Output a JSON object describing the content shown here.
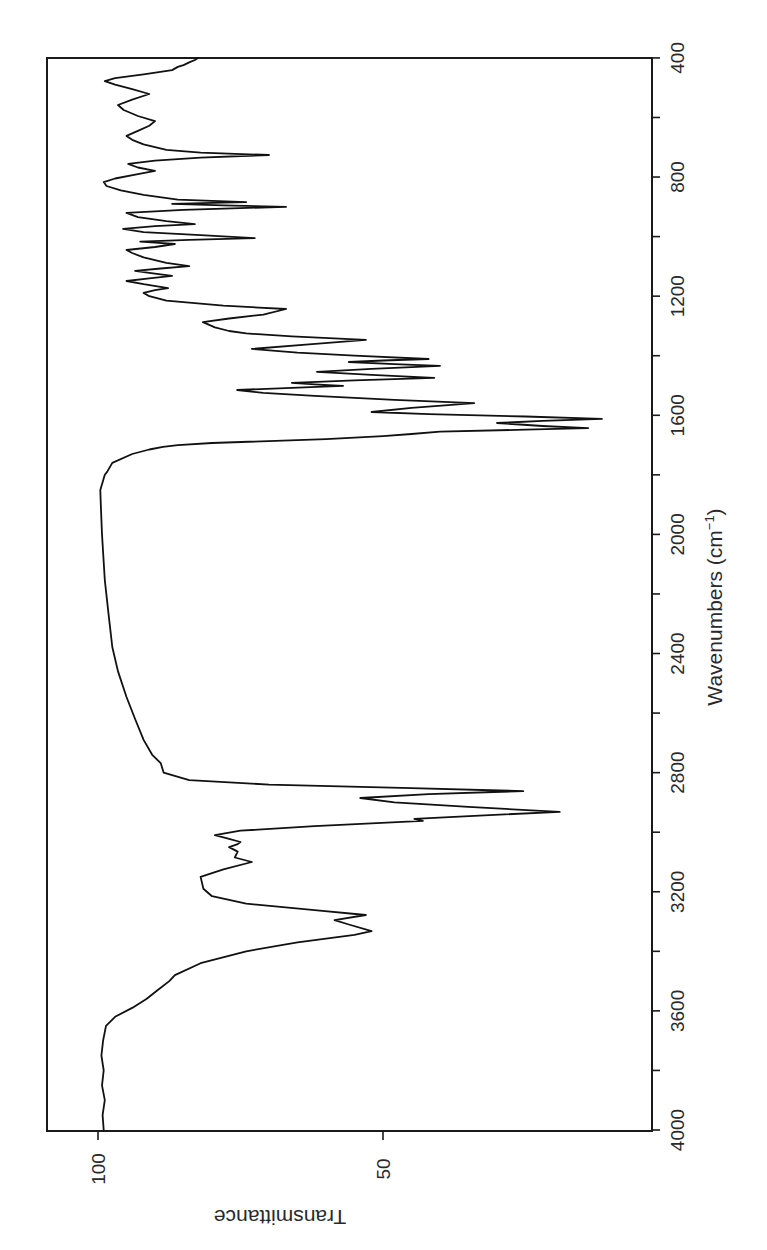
{
  "chart_data": {
    "type": "line",
    "title": "",
    "xlabel": "Wavenumbers (cm⁻¹)",
    "xlabel_base": "Wavenumbers (cm",
    "xlabel_sup": "−1",
    "xlabel_close": ")",
    "ylabel": "Transmittance",
    "xlim": [
      4000,
      400
    ],
    "ylim": [
      -3,
      109
    ],
    "x_reversed": true,
    "orientation": "rotated 90 degrees clockwise (wavenumber axis vertical on right, transmittance axis horizontal on bottom)",
    "grid": false,
    "legend": null,
    "x_ticks": [
      4000,
      3600,
      3200,
      2800,
      2400,
      2000,
      1600,
      1200,
      800,
      400
    ],
    "x_minor_tick_step": 200,
    "y_ticks": [
      100,
      50
    ],
    "series": [
      {
        "name": "IR spectrum",
        "color": "#111111",
        "points": [
          [
            4000,
            99.0
          ],
          [
            3950,
            99.2
          ],
          [
            3900,
            98.8
          ],
          [
            3850,
            99.3
          ],
          [
            3800,
            99.0
          ],
          [
            3750,
            99.4
          ],
          [
            3700,
            99.1
          ],
          [
            3650,
            98.6
          ],
          [
            3620,
            97.0
          ],
          [
            3590,
            94.0
          ],
          [
            3560,
            91.5
          ],
          [
            3530,
            89.5
          ],
          [
            3500,
            87.5
          ],
          [
            3480,
            86.5
          ],
          [
            3440,
            82.0
          ],
          [
            3400,
            74.0
          ],
          [
            3370,
            65.0
          ],
          [
            3345,
            55.0
          ],
          [
            3332,
            52.0
          ],
          [
            3310,
            56.0
          ],
          [
            3295,
            58.5
          ],
          [
            3278,
            53.0
          ],
          [
            3262,
            62.0
          ],
          [
            3240,
            74.0
          ],
          [
            3215,
            80.0
          ],
          [
            3190,
            81.5
          ],
          [
            3150,
            82.0
          ],
          [
            3125,
            78.0
          ],
          [
            3100,
            73.0
          ],
          [
            3085,
            76.0
          ],
          [
            3065,
            75.5
          ],
          [
            3050,
            77.0
          ],
          [
            3040,
            75.5
          ],
          [
            3033,
            75.0
          ],
          [
            3022,
            77.0
          ],
          [
            3010,
            79.5
          ],
          [
            2995,
            75.0
          ],
          [
            2980,
            62.0
          ],
          [
            2962,
            43.0
          ],
          [
            2955,
            44.5
          ],
          [
            2945,
            34.0
          ],
          [
            2932,
            19.0
          ],
          [
            2915,
            35.0
          ],
          [
            2900,
            48.0
          ],
          [
            2885,
            54.0
          ],
          [
            2872,
            42.0
          ],
          [
            2862,
            25.4
          ],
          [
            2852,
            45.0
          ],
          [
            2840,
            70.0
          ],
          [
            2825,
            84.0
          ],
          [
            2800,
            88.5
          ],
          [
            2768,
            89.0
          ],
          [
            2740,
            90.5
          ],
          [
            2690,
            92.0
          ],
          [
            2620,
            93.5
          ],
          [
            2546,
            95.0
          ],
          [
            2460,
            96.5
          ],
          [
            2378,
            97.5
          ],
          [
            2260,
            98.2
          ],
          [
            2153,
            98.8
          ],
          [
            2000,
            99.3
          ],
          [
            1900,
            99.5
          ],
          [
            1851,
            99.6
          ],
          [
            1800,
            98.8
          ],
          [
            1790,
            98.4
          ],
          [
            1760,
            97.5
          ],
          [
            1730,
            94.0
          ],
          [
            1715,
            91.0
          ],
          [
            1706,
            88.6
          ],
          [
            1700,
            86.0
          ],
          [
            1693,
            80.0
          ],
          [
            1680,
            60.0
          ],
          [
            1670,
            50.0
          ],
          [
            1663,
            45.0
          ],
          [
            1655,
            40.0
          ],
          [
            1648,
            25.0
          ],
          [
            1643,
            14.0
          ],
          [
            1636,
            22.0
          ],
          [
            1626,
            30.0
          ],
          [
            1619,
            22.0
          ],
          [
            1612,
            11.6
          ],
          [
            1604,
            25.0
          ],
          [
            1596,
            42.0
          ],
          [
            1589,
            52.0
          ],
          [
            1575,
            45.0
          ],
          [
            1565,
            38.0
          ],
          [
            1559,
            34.0
          ],
          [
            1548,
            48.0
          ],
          [
            1535,
            62.0
          ],
          [
            1525,
            71.0
          ],
          [
            1515,
            75.6
          ],
          [
            1508,
            66.0
          ],
          [
            1501,
            57.0
          ],
          [
            1496,
            62.0
          ],
          [
            1491,
            66.0
          ],
          [
            1483,
            55.0
          ],
          [
            1474,
            41.0
          ],
          [
            1464,
            52.0
          ],
          [
            1454,
            61.6
          ],
          [
            1444,
            52.0
          ],
          [
            1434,
            40.0
          ],
          [
            1428,
            48.0
          ],
          [
            1421,
            56.0
          ],
          [
            1416,
            50.0
          ],
          [
            1411,
            42.0
          ],
          [
            1400,
            55.0
          ],
          [
            1390,
            65.0
          ],
          [
            1377,
            73.0
          ],
          [
            1362,
            63.0
          ],
          [
            1347,
            53.0
          ],
          [
            1335,
            66.0
          ],
          [
            1325,
            74.0
          ],
          [
            1317,
            77.0
          ],
          [
            1305,
            79.5
          ],
          [
            1287,
            81.6
          ],
          [
            1275,
            77.0
          ],
          [
            1262,
            71.0
          ],
          [
            1243,
            67.0
          ],
          [
            1232,
            78.0
          ],
          [
            1215,
            88.0
          ],
          [
            1200,
            91.0
          ],
          [
            1189,
            92.0
          ],
          [
            1180,
            90.0
          ],
          [
            1173,
            87.7
          ],
          [
            1160,
            92.0
          ],
          [
            1149,
            95.0
          ],
          [
            1140,
            91.0
          ],
          [
            1132,
            87.0
          ],
          [
            1122,
            91.0
          ],
          [
            1115,
            93.5
          ],
          [
            1107,
            89.0
          ],
          [
            1099,
            84.0
          ],
          [
            1088,
            88.0
          ],
          [
            1070,
            92.0
          ],
          [
            1055,
            94.0
          ],
          [
            1045,
            95.0
          ],
          [
            1035,
            90.0
          ],
          [
            1025,
            86.5
          ],
          [
            1020,
            90.0
          ],
          [
            1017,
            92.6
          ],
          [
            1011,
            84.0
          ],
          [
            1005,
            72.5
          ],
          [
            995,
            82.0
          ],
          [
            985,
            92.0
          ],
          [
            974,
            95.6
          ],
          [
            965,
            90.0
          ],
          [
            958,
            83.0
          ],
          [
            948,
            88.0
          ],
          [
            935,
            93.0
          ],
          [
            920,
            95.0
          ],
          [
            910,
            85.0
          ],
          [
            900,
            67.0
          ],
          [
            895,
            78.0
          ],
          [
            890,
            87.0
          ],
          [
            887,
            80.0
          ],
          [
            884,
            74.0
          ],
          [
            876,
            86.0
          ],
          [
            860,
            92.0
          ],
          [
            845,
            96.0
          ],
          [
            830,
            98.5
          ],
          [
            817,
            99.0
          ],
          [
            805,
            97.0
          ],
          [
            790,
            93.0
          ],
          [
            779,
            90.0
          ],
          [
            768,
            93.0
          ],
          [
            756,
            94.7
          ],
          [
            745,
            90.0
          ],
          [
            735,
            82.0
          ],
          [
            726,
            70.0
          ],
          [
            718,
            82.0
          ],
          [
            709,
            88.0
          ],
          [
            690,
            92.0
          ],
          [
            675,
            94.0
          ],
          [
            662,
            95.0
          ],
          [
            645,
            93.0
          ],
          [
            628,
            91.0
          ],
          [
            612,
            90.0
          ],
          [
            595,
            93.0
          ],
          [
            575,
            95.5
          ],
          [
            558,
            96.5
          ],
          [
            540,
            94.0
          ],
          [
            521,
            91.0
          ],
          [
            505,
            94.0
          ],
          [
            490,
            97.0
          ],
          [
            478,
            98.8
          ],
          [
            468,
            97.0
          ],
          [
            455,
            92.0
          ],
          [
            441,
            87.0
          ],
          [
            430,
            86.0
          ],
          [
            424,
            85.0
          ],
          [
            415,
            84.0
          ],
          [
            407,
            83.0
          ],
          [
            400,
            82.5
          ]
        ]
      }
    ],
    "annotations": []
  },
  "layout": {
    "frame": {
      "left": 47,
      "top": 58,
      "right": 652,
      "bottom": 1131
    },
    "wavenumber_to_y": {
      "origin_wn": 4000,
      "origin_px": 1130,
      "px_per_unit": 0.2978
    },
    "transmittance_to_x": {
      "ref_value": 100,
      "ref_px": 98,
      "px_per_unit": 5.7
    }
  }
}
